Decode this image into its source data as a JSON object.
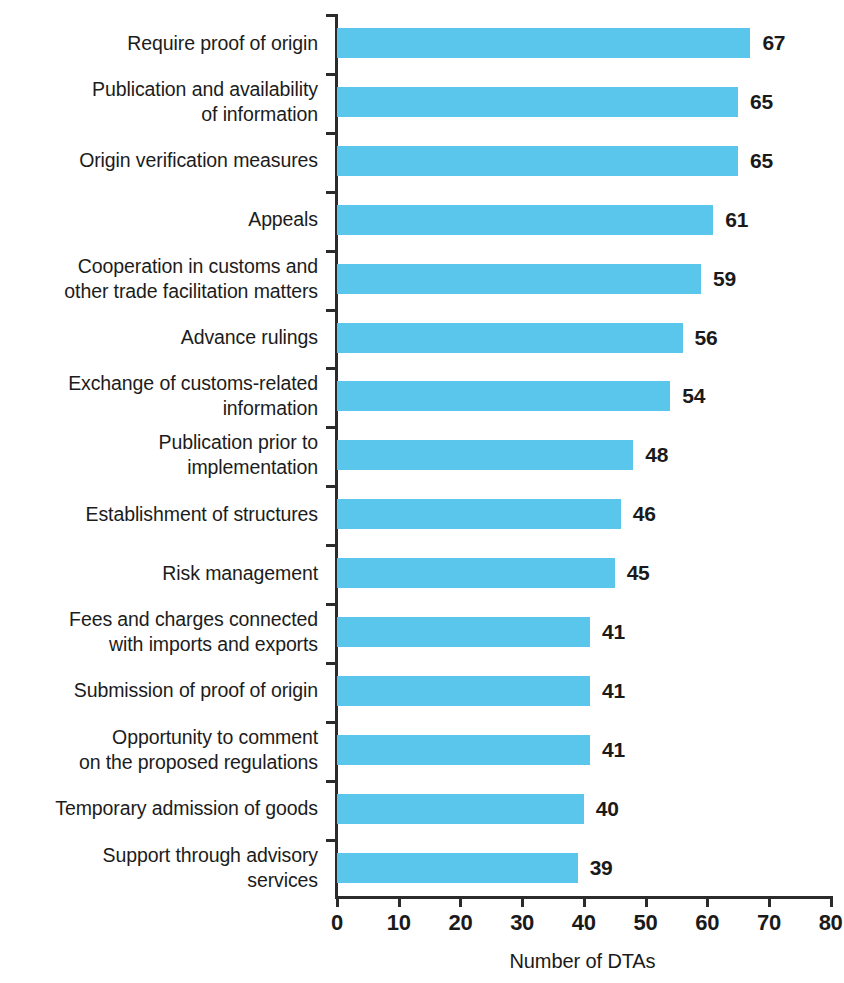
{
  "chart_data": {
    "type": "bar",
    "orientation": "horizontal",
    "title": "",
    "subtitle": "",
    "xlabel": "Number of DTAs",
    "ylabel": "",
    "xlim": [
      0,
      80
    ],
    "xticks": [
      0,
      10,
      20,
      30,
      40,
      50,
      60,
      70,
      80
    ],
    "xtick_labels": [
      "0",
      "10",
      "20",
      "30",
      "40",
      "50",
      "60",
      "70",
      "80"
    ],
    "grid": false,
    "legend": false,
    "legend_position": "none",
    "bar_color": "#5bc6ec",
    "axis_color": "#2b2b2b",
    "text_color": "#1a1a1a",
    "categories": [
      "Require proof of origin",
      "Publication and availability\nof information",
      "Origin verification measures",
      "Appeals",
      "Cooperation in customs and\nother trade facilitation matters",
      "Advance rulings",
      "Exchange of customs-related\ninformation",
      "Publication prior to\nimplementation",
      "Establishment of structures",
      "Risk management",
      "Fees and charges connected\nwith imports and exports",
      "Submission of proof of origin",
      "Opportunity to comment\non the proposed regulations",
      "Temporary admission of goods",
      "Support through advisory\nservices"
    ],
    "values": [
      67,
      65,
      65,
      61,
      59,
      56,
      54,
      48,
      46,
      45,
      41,
      41,
      41,
      40,
      39
    ],
    "value_labels": [
      "67",
      "65",
      "65",
      "61",
      "59",
      "56",
      "54",
      "48",
      "46",
      "45",
      "41",
      "41",
      "41",
      "40",
      "39"
    ]
  }
}
